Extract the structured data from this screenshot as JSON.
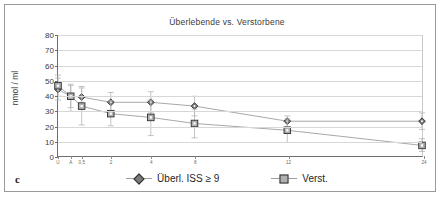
{
  "panel": {
    "label": "c"
  },
  "chart_data": {
    "type": "line",
    "title": "Überlebende vs. Verstorbene",
    "xlabel": "",
    "ylabel": "nmol / ml",
    "ylim": [
      0,
      80
    ],
    "ytick_step": 10,
    "yticks": [
      "80",
      "70",
      "60",
      "50",
      "40",
      "30",
      "20",
      "10",
      "0"
    ],
    "grid": true,
    "legend_position": "bottom",
    "categories": [
      "U",
      "A",
      "0,5",
      "2",
      "4",
      "8",
      "12",
      "24"
    ],
    "x_positions": [
      0.0,
      3.5,
      6.5,
      14.5,
      25.5,
      37.5,
      63.0,
      100.0
    ],
    "series": [
      {
        "name": "Überl. ISS ≥ 9",
        "marker": "diamond",
        "values": [
          44.0,
          39.5,
          39.0,
          35.5,
          35.5,
          33.0,
          23.0,
          23.0
        ],
        "err_low": [
          37.0,
          32.0,
          31.5,
          29.5,
          28.5,
          26.5,
          19.5,
          17.5
        ],
        "err_high": [
          51.5,
          46.5,
          46.0,
          42.0,
          42.5,
          39.5,
          26.5,
          28.5
        ]
      },
      {
        "name": "Verst.",
        "marker": "square",
        "values": [
          46.5,
          39.5,
          33.0,
          28.0,
          25.5,
          21.5,
          17.0,
          7.0
        ],
        "err_low": [
          39.5,
          29.5,
          20.5,
          20.0,
          13.5,
          12.0,
          9.0,
          3.0
        ],
        "err_high": [
          53.5,
          47.5,
          45.0,
          36.5,
          37.0,
          31.0,
          24.5,
          11.5
        ]
      }
    ]
  },
  "colors": {
    "series1_marker": "#7a7a7a",
    "series2_marker": "#b0b0b0",
    "marker_stroke": "#2e2e2e",
    "line": "#9d9d9d",
    "grid": "#d7d7d7",
    "axis": "#6d6d6d",
    "frame": "#9a9a9a",
    "text": "#3a3a3a"
  }
}
